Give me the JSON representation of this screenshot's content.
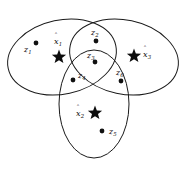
{
  "figure": {
    "background_color": "#ffffff",
    "stroke_color": "#1a1a1a",
    "point_color": "#111111",
    "width": 185,
    "height": 173
  },
  "regions": [
    {
      "name": "left-cluster-region",
      "cx": 62,
      "cy": 57,
      "rx": 55,
      "ry": 37,
      "rotation": -12
    },
    {
      "name": "right-cluster-region",
      "cx": 124,
      "cy": 57,
      "rx": 55,
      "ry": 37,
      "rotation": 12
    },
    {
      "name": "bottom-cluster-region",
      "cx": 94,
      "cy": 104,
      "rx": 35,
      "ry": 54,
      "rotation": 0
    }
  ],
  "data_points": [
    {
      "id": "z1",
      "label": "z",
      "sub": "1",
      "dot_x": 36,
      "dot_y": 43,
      "label_x": 24,
      "label_y": 46
    },
    {
      "id": "z2",
      "label": "z",
      "sub": "2",
      "dot_x": 96,
      "dot_y": 41,
      "label_x": 91,
      "label_y": 29
    },
    {
      "id": "z3",
      "label": "z",
      "sub": "3",
      "dot_x": 95,
      "dot_y": 62,
      "label_x": 87,
      "label_y": 52
    },
    {
      "id": "z4",
      "label": "z",
      "sub": "4",
      "dot_x": 73,
      "dot_y": 80,
      "label_x": 78,
      "label_y": 72
    },
    {
      "id": "z5",
      "label": "z",
      "sub": "5",
      "dot_x": 102,
      "dot_y": 131,
      "label_x": 109,
      "label_y": 128
    },
    {
      "id": "z6",
      "label": "z",
      "sub": "6",
      "dot_x": 121,
      "dot_y": 81,
      "label_x": 116,
      "label_y": 69
    }
  ],
  "centers": [
    {
      "id": "x1",
      "label": "x",
      "sub": "1",
      "star_x": 59,
      "star_y": 57,
      "size": 15,
      "label_x": 54,
      "label_y": 38
    },
    {
      "id": "x2",
      "label": "x",
      "sub": "2",
      "star_x": 95,
      "star_y": 113,
      "size": 15,
      "label_x": 76,
      "label_y": 110
    },
    {
      "id": "x3",
      "label": "x",
      "sub": "3",
      "star_x": 134,
      "star_y": 56,
      "size": 15,
      "label_x": 143,
      "label_y": 51
    }
  ]
}
